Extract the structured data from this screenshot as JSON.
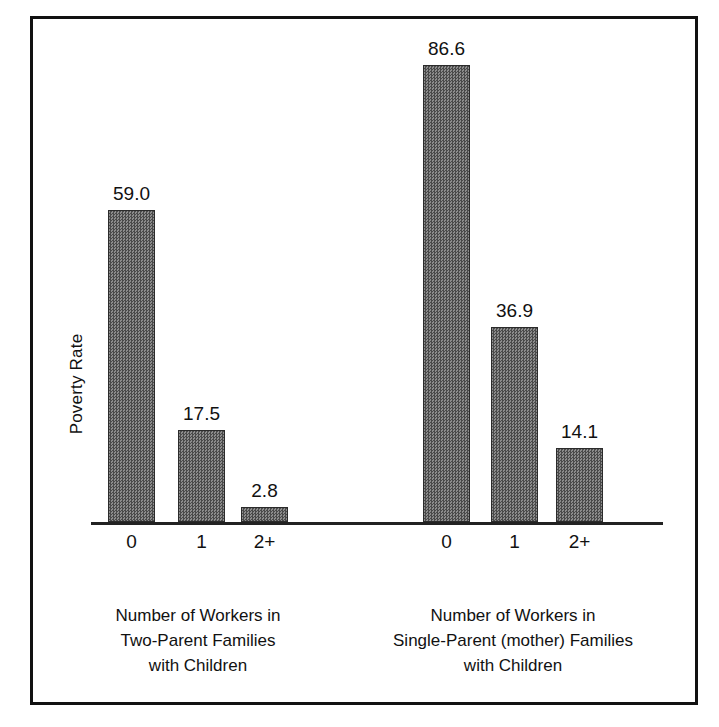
{
  "chart_data": {
    "type": "bar",
    "title": "",
    "xlabel": "",
    "ylabel": "Poverty Rate",
    "ylim": [
      0,
      92
    ],
    "grid": false,
    "legend": "none",
    "value_label_format": "one-decimal",
    "groups": [
      {
        "caption_lines": [
          "Number of Workers in",
          "Two-Parent Families",
          "with Children"
        ],
        "categories": [
          "0",
          "1",
          "2+"
        ],
        "values": [
          59.0,
          17.5,
          2.8
        ],
        "value_labels": [
          "59.0",
          "17.5",
          "2.8"
        ]
      },
      {
        "caption_lines": [
          "Number of Workers in",
          "Single-Parent (mother) Families",
          "with Children"
        ],
        "categories": [
          "0",
          "1",
          "2+"
        ],
        "values": [
          86.6,
          36.9,
          14.1
        ],
        "value_labels": [
          "86.6",
          "36.9",
          "14.1"
        ]
      }
    ]
  },
  "style": {
    "bar_fill": "#6e6e6e",
    "bar_border": "#2b2b2b",
    "axis_color": "#222222",
    "frame_color": "#111111",
    "text_color": "#111111",
    "background": "#ffffff"
  },
  "geometry": {
    "baseline_y": 503,
    "px_per_unit": 5.28,
    "bar_width": 47,
    "group_bar_lefts": [
      [
        75,
        145,
        208
      ],
      [
        390,
        458,
        523
      ]
    ]
  }
}
